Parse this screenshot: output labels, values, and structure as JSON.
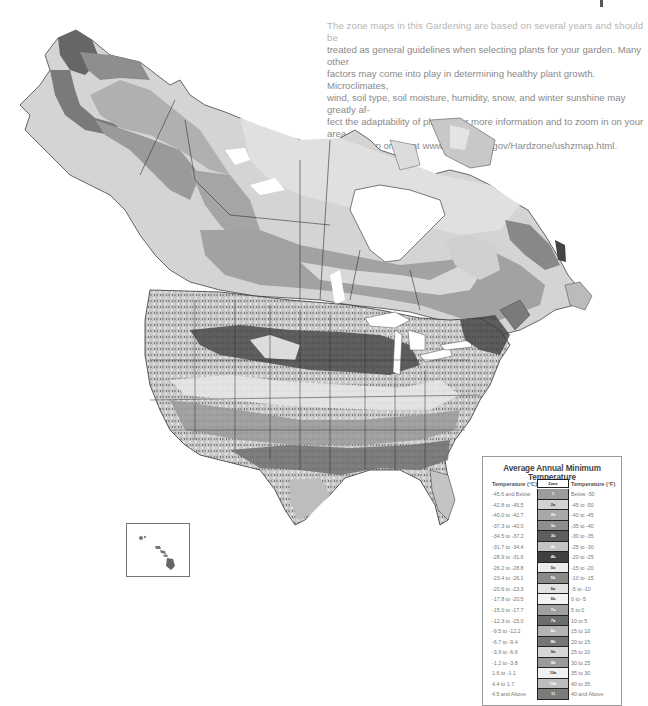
{
  "intro": {
    "first_line": "The zone maps in this Gardening are based on several years and should be",
    "lines": [
      "treated as general guidelines when selecting plants for your garden. Many other",
      "factors may come into play in determining healthy plant growth. Microclimates,",
      "wind, soil type, soil moisture, humidity, snow, and winter sunshine may greatly af-",
      "fect the adaptability of plants. For more information and to zoom in on your area,",
      "visit the map online at www.usna.usda.gov/Hardzone/ushzmap.html."
    ]
  },
  "map": {
    "name": "Plant Hardiness Zone Map of North America",
    "regions": [
      "Alaska",
      "Canada",
      "Contiguous United States",
      "Hawaii inset"
    ],
    "water_color": "#ffffff",
    "border_color": "#333333"
  },
  "legend": {
    "title": "Average Annual Minimum Temperature",
    "col_celsius": "Temperature (°C)",
    "col_zone": "Zone",
    "col_fahrenheit": "Temperature (°F)",
    "rows": [
      {
        "c": "-45.6 and Below",
        "zone": "1",
        "f": "Below -50",
        "color": "#9c9c9c"
      },
      {
        "c": "-42.8 to -45.5",
        "zone": "2a",
        "f": "-45 to -50",
        "color": "#d2d2d2"
      },
      {
        "c": "-40.0 to -42.7",
        "zone": "2b",
        "f": "-40 to -45",
        "color": "#a8a8a8"
      },
      {
        "c": "-37.3 to -40.0",
        "zone": "3a",
        "f": "-35 to -40",
        "color": "#8e8e8e"
      },
      {
        "c": "-34.5 to -37.2",
        "zone": "3b",
        "f": "-30 to -35",
        "color": "#5e5e5e"
      },
      {
        "c": "-31.7 to -34.4",
        "zone": "4a",
        "f": "-25 to -30",
        "color": "#c4c4c4"
      },
      {
        "c": "-28.9 to -31.6",
        "zone": "4b",
        "f": "-20 to -25",
        "color": "#404040"
      },
      {
        "c": "-26.2 to -28.8",
        "zone": "5a",
        "f": "-15 to -20",
        "color": "#ececec"
      },
      {
        "c": "-23.4 to -26.1",
        "zone": "5b",
        "f": "-10 to -15",
        "color": "#8a8a8a"
      },
      {
        "c": "-20.6 to -23.3",
        "zone": "6a",
        "f": "-5 to -10",
        "color": "#e2e2e2"
      },
      {
        "c": "-17.8 to -20.5",
        "zone": "6b",
        "f": "0 to -5",
        "color": "#f2f2f2"
      },
      {
        "c": "-15.0 to -17.7",
        "zone": "7a",
        "f": "5 to 0",
        "color": "#a0a0a0"
      },
      {
        "c": "-12.3 to -15.0",
        "zone": "7b",
        "f": "10 to 5",
        "color": "#6c6c6c"
      },
      {
        "c": "-9.5 to -12.2",
        "zone": "8a",
        "f": "15 to 10",
        "color": "#b4b4b4"
      },
      {
        "c": "-6.7 to -9.4",
        "zone": "8b",
        "f": "20 to 15",
        "color": "#767676"
      },
      {
        "c": "-3.9 to -6.6",
        "zone": "9a",
        "f": "25 to 20",
        "color": "#d6d6d6"
      },
      {
        "c": "-1.2 to -3.8",
        "zone": "9b",
        "f": "30 to 25",
        "color": "#9a9a9a"
      },
      {
        "c": "1.6 to -1.1",
        "zone": "10a",
        "f": "35 to 30",
        "color": "#f0f0f0"
      },
      {
        "c": "4.4 to 1.7",
        "zone": "10b",
        "f": "40 to 35",
        "color": "#bcbcbc"
      },
      {
        "c": "4.5 and Above",
        "zone": "11",
        "f": "40 and Above",
        "color": "#7c7c7c"
      }
    ]
  }
}
